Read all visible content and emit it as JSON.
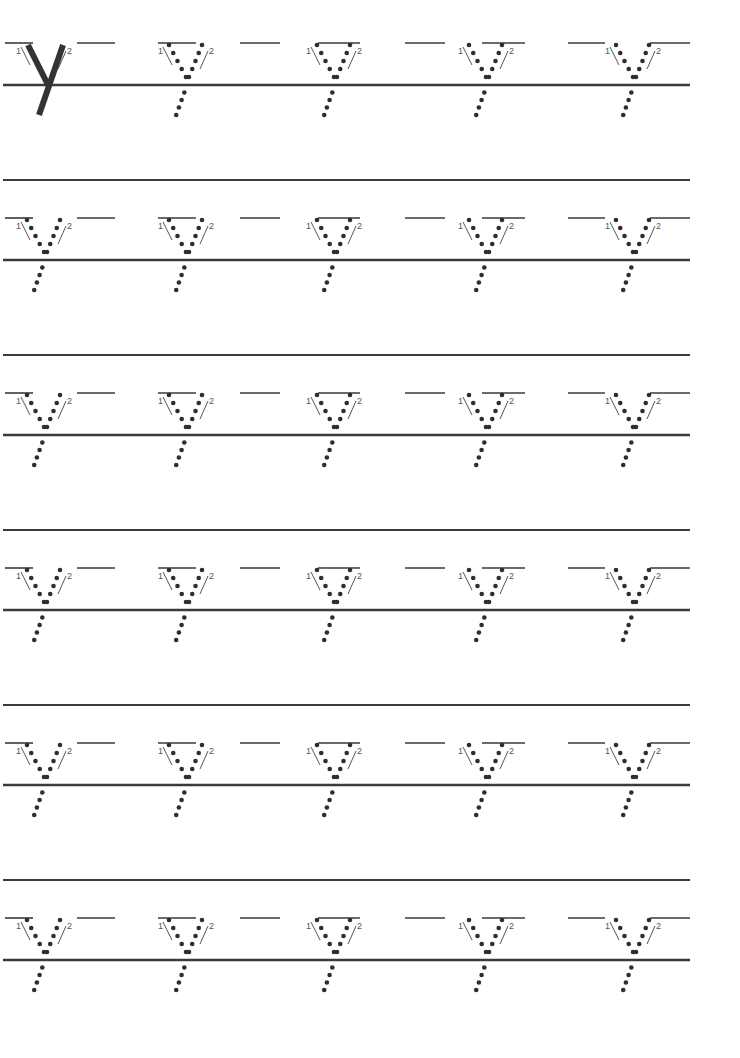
{
  "worksheet": {
    "letter": "y",
    "model_letter": "y",
    "stroke_labels": [
      "1",
      "2"
    ],
    "rows": 6,
    "letters_per_row": 5,
    "first_letter_solid": true,
    "colors": {
      "ink": "#3a3a3a",
      "dots": "#2e2e2e",
      "paper": "#ffffff",
      "guide": "#444444"
    },
    "layout": {
      "row_dash_y": [
        43,
        218,
        393,
        568,
        743,
        918
      ],
      "row_base_y": [
        85,
        260,
        435,
        610,
        785,
        960
      ],
      "row_top_y": [
        null,
        180,
        355,
        530,
        705,
        880
      ],
      "letter_x": [
        40,
        185,
        333,
        485,
        632
      ],
      "line_x_end": 690
    }
  }
}
